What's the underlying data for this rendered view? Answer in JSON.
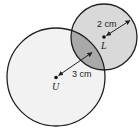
{
  "diagram": {
    "type": "two-overlapping-circles",
    "circle_u": {
      "center_label": "U",
      "radius_label": "3 cm",
      "cx": 56,
      "cy": 77,
      "r": 49,
      "fill": "#f2f2f2"
    },
    "circle_l": {
      "center_label": "L",
      "radius_label": "2 cm",
      "cx": 104,
      "cy": 37,
      "r": 33,
      "fill": "#d9d9d9"
    },
    "overlap_fill": "#a9a9a9",
    "stroke_color": "#222222"
  }
}
